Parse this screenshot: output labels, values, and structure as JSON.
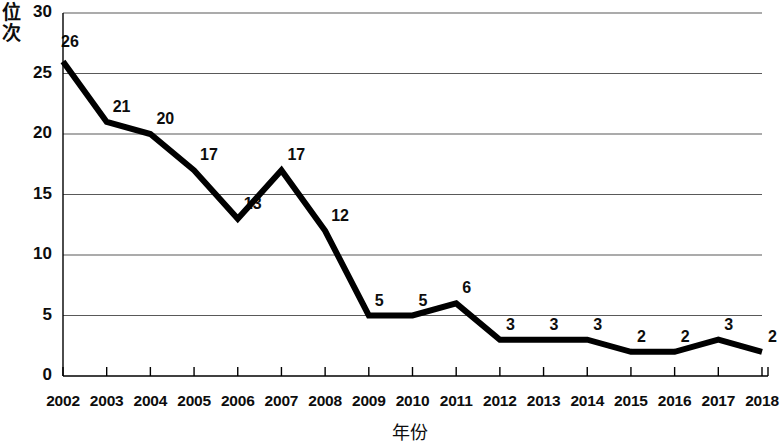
{
  "chart_data": {
    "type": "line",
    "title": "",
    "xlabel": "年份",
    "ylabel": "位次",
    "categories": [
      "2002",
      "2003",
      "2004",
      "2005",
      "2006",
      "2007",
      "2008",
      "2009",
      "2010",
      "2011",
      "2012",
      "2013",
      "2014",
      "2015",
      "2016",
      "2017",
      "2018"
    ],
    "values": [
      26,
      21,
      20,
      17,
      13,
      17,
      12,
      5,
      5,
      6,
      3,
      3,
      3,
      2,
      2,
      3,
      2
    ],
    "series": [
      {
        "name": "位次",
        "values": [
          26,
          21,
          20,
          17,
          13,
          17,
          12,
          5,
          5,
          6,
          3,
          3,
          3,
          2,
          2,
          3,
          2
        ]
      }
    ],
    "ylim": [
      0,
      30
    ],
    "yticks": [
      0,
      5,
      10,
      15,
      20,
      25,
      30
    ],
    "ytick_labels": [
      "0",
      "5",
      "10",
      "15",
      "20",
      "25",
      "30"
    ],
    "grid": true,
    "grid_axis": "y",
    "legend": false,
    "legend_position": "none",
    "data_labels": [
      "26",
      "21",
      "20",
      "17",
      "13",
      "17",
      "12",
      "5",
      "5",
      "6",
      "3",
      "3",
      "3",
      "2",
      "2",
      "3",
      "2"
    ],
    "line_color": "#000000",
    "grid_color": "#595959",
    "axis_color": "#000000",
    "background_color": "#ffffff"
  }
}
